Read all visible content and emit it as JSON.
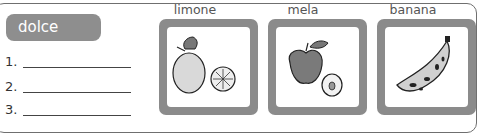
{
  "exercise": {
    "category_heading": "dolce",
    "answer_lines": [
      {
        "number": "1.",
        "value": ""
      },
      {
        "number": "2.",
        "value": ""
      },
      {
        "number": "3.",
        "value": ""
      }
    ]
  },
  "cards": [
    {
      "label": "limone",
      "icon": "lemon-icon"
    },
    {
      "label": "mela",
      "icon": "apple-icon"
    },
    {
      "label": "banana",
      "icon": "banana-icon"
    }
  ],
  "colors": {
    "pill_bg": "#8e8e8e",
    "card_border": "#8b8b8b",
    "frame_border": "#6f6f6f"
  }
}
